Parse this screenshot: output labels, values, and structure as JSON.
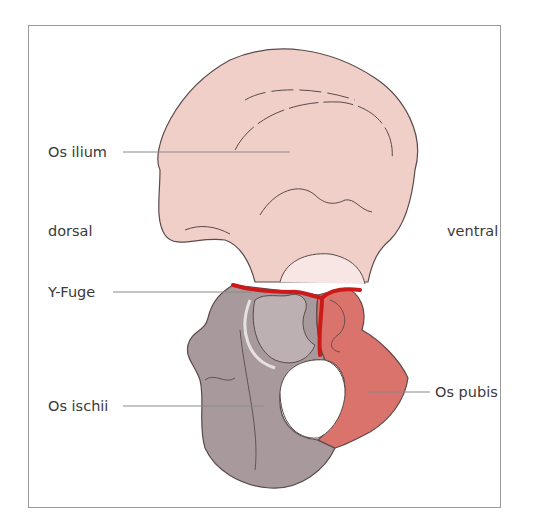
{
  "figure": {
    "type": "anatomical diagram"
  },
  "orientation": {
    "left": "dorsal",
    "right": "ventral"
  },
  "labels": [
    {
      "id": "os-ilium",
      "text": "Os ilium"
    },
    {
      "id": "y-fuge",
      "text": "Y-Fuge"
    },
    {
      "id": "os-ischii",
      "text": "Os ischii"
    },
    {
      "id": "os-pubis",
      "text": "Os pubis"
    }
  ],
  "colors": {
    "ilium": "#f0cfc9",
    "ischium": "#a89a9c",
    "pubis": "#d9736c",
    "y_fuge": "#cc1a1a",
    "outline": "#5a4a4a",
    "leader": "#8a8a8a",
    "frame": "#9a9a9a"
  }
}
